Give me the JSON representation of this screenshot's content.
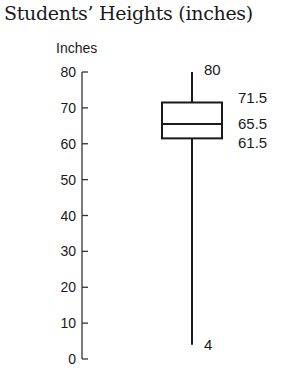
{
  "chart_data": {
    "type": "boxplot",
    "title": "Students’ Heights (inches)",
    "ylabel": "Inches",
    "xlabel": "",
    "ylim": [
      0,
      80
    ],
    "yticks": [
      0,
      10,
      20,
      30,
      40,
      50,
      60,
      70,
      80
    ],
    "ytick_labels": [
      "0",
      "10",
      "20",
      "30",
      "40",
      "50",
      "60",
      "70",
      "80"
    ],
    "grid": false,
    "legend": null,
    "box": {
      "min": 4,
      "q1": 61.5,
      "median": 65.5,
      "q3": 71.5,
      "max": 80
    },
    "annotations": [
      {
        "text": "80",
        "value": 80
      },
      {
        "text": "71.5",
        "value": 71.5
      },
      {
        "text": "65.5",
        "value": 65.5
      },
      {
        "text": "61.5",
        "value": 61.5
      },
      {
        "text": "4",
        "value": 4
      }
    ]
  },
  "colors": {
    "ink": "#1a1a1a",
    "axis": "#333333",
    "background": "#ffffff"
  }
}
